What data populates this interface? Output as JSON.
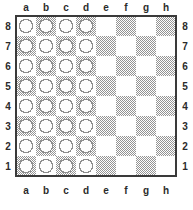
{
  "board": {
    "title": "Chessboard diagram",
    "files": [
      "a",
      "b",
      "c",
      "d",
      "e",
      "f",
      "g",
      "h"
    ],
    "ranks": [
      "8",
      "7",
      "6",
      "5",
      "4",
      "3",
      "2",
      "1"
    ],
    "label_positions": [
      "top",
      "bottom",
      "left",
      "right"
    ],
    "square_size": 20,
    "origin_x": 16,
    "origin_y": 16,
    "light_square_color": "#ffffff",
    "dark_square_color": "#9a9a9a",
    "border_color": "#3a3a3a",
    "label_color": "#2b2b2b",
    "a8_is_light": true,
    "piece_fill_color": "#fdfdfd",
    "piece_outline_color": "#8e8e8e",
    "piece_glyph": "circle-outline",
    "piece_radius": 6.6,
    "occupied_files": [
      "a",
      "b",
      "c",
      "d"
    ],
    "piece_count": 32,
    "pieces": [
      {
        "file": "a",
        "rank": "8",
        "glyph": "circle-outline"
      },
      {
        "file": "b",
        "rank": "8",
        "glyph": "circle-outline"
      },
      {
        "file": "c",
        "rank": "8",
        "glyph": "circle-outline"
      },
      {
        "file": "d",
        "rank": "8",
        "glyph": "circle-outline"
      },
      {
        "file": "a",
        "rank": "7",
        "glyph": "circle-outline"
      },
      {
        "file": "b",
        "rank": "7",
        "glyph": "circle-outline"
      },
      {
        "file": "c",
        "rank": "7",
        "glyph": "circle-outline"
      },
      {
        "file": "d",
        "rank": "7",
        "glyph": "circle-outline"
      },
      {
        "file": "a",
        "rank": "6",
        "glyph": "circle-outline"
      },
      {
        "file": "b",
        "rank": "6",
        "glyph": "circle-outline"
      },
      {
        "file": "c",
        "rank": "6",
        "glyph": "circle-outline"
      },
      {
        "file": "d",
        "rank": "6",
        "glyph": "circle-outline"
      },
      {
        "file": "a",
        "rank": "5",
        "glyph": "circle-outline"
      },
      {
        "file": "b",
        "rank": "5",
        "glyph": "circle-outline"
      },
      {
        "file": "c",
        "rank": "5",
        "glyph": "circle-outline"
      },
      {
        "file": "d",
        "rank": "5",
        "glyph": "circle-outline"
      },
      {
        "file": "a",
        "rank": "4",
        "glyph": "circle-outline"
      },
      {
        "file": "b",
        "rank": "4",
        "glyph": "circle-outline"
      },
      {
        "file": "c",
        "rank": "4",
        "glyph": "circle-outline"
      },
      {
        "file": "d",
        "rank": "4",
        "glyph": "circle-outline"
      },
      {
        "file": "a",
        "rank": "3",
        "glyph": "circle-outline"
      },
      {
        "file": "b",
        "rank": "3",
        "glyph": "circle-outline"
      },
      {
        "file": "c",
        "rank": "3",
        "glyph": "circle-outline"
      },
      {
        "file": "d",
        "rank": "3",
        "glyph": "circle-outline"
      },
      {
        "file": "a",
        "rank": "2",
        "glyph": "circle-outline"
      },
      {
        "file": "b",
        "rank": "2",
        "glyph": "circle-outline"
      },
      {
        "file": "c",
        "rank": "2",
        "glyph": "circle-outline"
      },
      {
        "file": "d",
        "rank": "2",
        "glyph": "circle-outline"
      },
      {
        "file": "a",
        "rank": "1",
        "glyph": "circle-outline"
      },
      {
        "file": "b",
        "rank": "1",
        "glyph": "circle-outline"
      },
      {
        "file": "c",
        "rank": "1",
        "glyph": "circle-outline"
      },
      {
        "file": "d",
        "rank": "1",
        "glyph": "circle-outline"
      }
    ]
  }
}
